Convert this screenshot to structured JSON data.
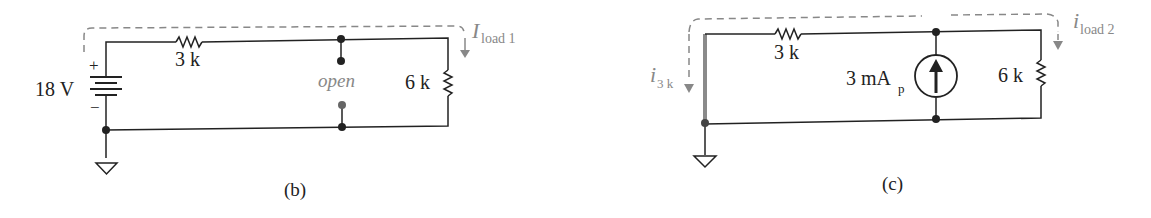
{
  "circuit_b": {
    "source_label": "18 V",
    "plus": "+",
    "minus": "−",
    "resistor1_label": "3 k",
    "resistor2_label": "6 k",
    "open_label": "open",
    "current_label_main": "I",
    "current_label_sub": "load 1",
    "caption": "(b)"
  },
  "circuit_c": {
    "current_3k_main": "i",
    "current_3k_sub": "3 k",
    "resistor1_label": "3 k",
    "source_label_main": "3 mA",
    "source_label_sub": "p",
    "resistor2_label": "6 k",
    "current_label_main": "i",
    "current_label_sub": "load 2",
    "caption": "(c)"
  },
  "colors": {
    "wire": "#222222",
    "annotation": "#888888",
    "highlight": "#8a8a8a"
  }
}
